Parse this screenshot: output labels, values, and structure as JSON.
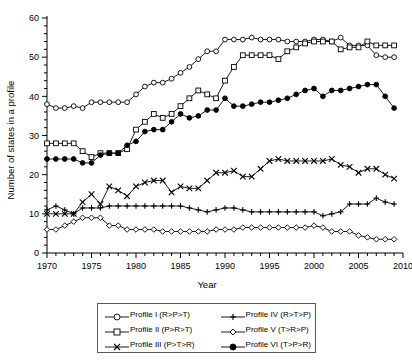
{
  "chart_data": {
    "type": "line",
    "title": "",
    "xlabel": "Year",
    "ylabel": "Number of states in a profile",
    "xlim": [
      1970,
      2010
    ],
    "ylim": [
      0,
      60
    ],
    "xticks": [
      1970,
      1975,
      1980,
      1985,
      1990,
      1995,
      2000,
      2005,
      2010
    ],
    "yticks": [
      0,
      10,
      20,
      30,
      40,
      50,
      60
    ],
    "xtick_labels": [
      "1970",
      "1975",
      "1980",
      "1985",
      "1990",
      "1995",
      "2000",
      "2005",
      "2010"
    ],
    "ytick_labels": [
      "0",
      "10",
      "20",
      "30",
      "40",
      "50",
      "60"
    ],
    "xminor_step": 1,
    "yminor_step": 2,
    "grid": false,
    "legend_position": "below-center",
    "x": [
      1970,
      1971,
      1972,
      1973,
      1974,
      1975,
      1976,
      1977,
      1978,
      1979,
      1980,
      1981,
      1982,
      1983,
      1984,
      1985,
      1986,
      1987,
      1988,
      1989,
      1990,
      1991,
      1992,
      1993,
      1994,
      1995,
      1996,
      1997,
      1998,
      1999,
      2000,
      2001,
      2002,
      2003,
      2004,
      2005,
      2006,
      2007,
      2008,
      2009
    ],
    "series": [
      {
        "name": "Profile I (R>P>T)",
        "marker": "open-circle",
        "values": [
          38,
          37,
          37,
          37.5,
          37,
          38.5,
          38.5,
          38.5,
          38.5,
          38.5,
          40.5,
          42.5,
          43.5,
          43.5,
          44.5,
          46,
          47.5,
          49.5,
          51.5,
          51.5,
          54.5,
          54.5,
          54.5,
          55,
          54.5,
          54.5,
          54.5,
          54,
          54,
          54,
          54.5,
          54.5,
          54,
          55,
          53,
          53,
          53,
          50.5,
          50,
          50
        ]
      },
      {
        "name": "Profile II (P>R>T)",
        "marker": "open-square",
        "values": [
          28,
          28,
          28,
          28,
          26,
          24.5,
          25.5,
          25.5,
          25.5,
          26.5,
          31.5,
          33.5,
          35.5,
          34.5,
          35.5,
          37.5,
          39.5,
          41.5,
          40.5,
          39.5,
          44,
          47.5,
          50.5,
          50.5,
          50.5,
          50.5,
          49.5,
          51.5,
          52.5,
          53.5,
          54,
          54,
          54,
          52,
          52.5,
          52.5,
          54,
          53,
          53,
          53
        ]
      },
      {
        "name": "Profile III (P>T>R)",
        "marker": "x-cross",
        "values": [
          10,
          10,
          10,
          10,
          13,
          15,
          12.5,
          17,
          16,
          14.5,
          17,
          18,
          18.5,
          18.5,
          15.5,
          17,
          16.5,
          16.5,
          18.5,
          20.5,
          20.5,
          21,
          19.5,
          19.5,
          21.5,
          23.5,
          24,
          23.5,
          23.5,
          23.5,
          23.5,
          23.5,
          24,
          22.5,
          22,
          20.5,
          21.5,
          21.5,
          20,
          19
        ]
      },
      {
        "name": "Profile IV (R>T>P)",
        "marker": "plus",
        "values": [
          11,
          12,
          11,
          10,
          11.5,
          11.5,
          11.5,
          12,
          12,
          12,
          12,
          12,
          12,
          12,
          12,
          12,
          11.5,
          11,
          10.5,
          11,
          11.5,
          11.5,
          11,
          10.5,
          10.5,
          10.5,
          10.5,
          10.5,
          10.5,
          10.5,
          10.5,
          9.5,
          10,
          10.5,
          12.5,
          12.5,
          12.5,
          14,
          13,
          12.5
        ]
      },
      {
        "name": "Profile V (T>R>P)",
        "marker": "open-diamond",
        "values": [
          6,
          6,
          7,
          8,
          9,
          9,
          9,
          7,
          7,
          6,
          6,
          6,
          6,
          5.5,
          5.5,
          5.5,
          5.5,
          5.5,
          5.5,
          6,
          6,
          6,
          6.5,
          6.5,
          6.5,
          6.5,
          6.5,
          6.5,
          6.5,
          6.5,
          7,
          6.5,
          5.5,
          5.5,
          5.5,
          4.5,
          4,
          3.5,
          3.5,
          3.5
        ]
      },
      {
        "name": "Profile VI (T>P>R)",
        "marker": "filled-circle",
        "values": [
          24,
          24,
          24,
          24,
          23,
          23,
          25,
          25.5,
          25.5,
          27.5,
          28.5,
          31,
          31.5,
          31.5,
          33.5,
          35.5,
          34.5,
          35,
          36.5,
          36.5,
          39.5,
          37.5,
          37.5,
          38,
          38.5,
          38.5,
          39,
          39.5,
          40.5,
          41.5,
          42,
          40,
          41.5,
          41.5,
          42,
          42.5,
          43,
          43,
          40,
          37
        ]
      }
    ]
  },
  "legend": {
    "entries": [
      {
        "label": "Profile I (R>P>T)",
        "marker": "open-circle"
      },
      {
        "label": "Profile II (P>R>T)",
        "marker": "open-square"
      },
      {
        "label": "Profile III (P>T>R)",
        "marker": "x-cross"
      },
      {
        "label": "Profile IV (R>T>P)",
        "marker": "plus"
      },
      {
        "label": "Profile V (T>R>P)",
        "marker": "open-diamond"
      },
      {
        "label": "Profile VI (T>P>R)",
        "marker": "filled-circle"
      }
    ]
  }
}
